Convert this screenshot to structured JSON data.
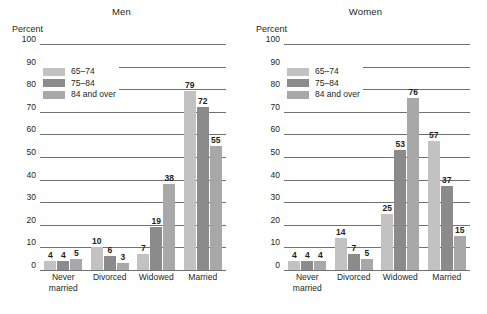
{
  "axis_title": "Percent",
  "legend": {
    "items": [
      {
        "label": "65–74",
        "color": "#c2c2c2"
      },
      {
        "label": "75–84",
        "color": "#8b8b8b"
      },
      {
        "label": "84 and over",
        "color": "#a8a8a8"
      }
    ]
  },
  "chart_data": [
    {
      "type": "bar",
      "title": "Men",
      "xlabel": "",
      "ylabel": "Percent",
      "ylim": [
        0,
        100
      ],
      "yticks": [
        0,
        10,
        20,
        30,
        40,
        50,
        60,
        70,
        80,
        90,
        100
      ],
      "grid": true,
      "legend_position": "upper-left",
      "categories": [
        "Never married",
        "Divorced",
        "Widowed",
        "Married"
      ],
      "series": [
        {
          "name": "65–74",
          "color": "#c2c2c2",
          "values": [
            4,
            10,
            7,
            79
          ]
        },
        {
          "name": "75–84",
          "color": "#8b8b8b",
          "values": [
            4,
            6,
            19,
            72
          ]
        },
        {
          "name": "84 and over",
          "color": "#a8a8a8",
          "values": [
            5,
            3,
            38,
            55
          ]
        }
      ]
    },
    {
      "type": "bar",
      "title": "Women",
      "xlabel": "",
      "ylabel": "Percent",
      "ylim": [
        0,
        100
      ],
      "yticks": [
        0,
        10,
        20,
        30,
        40,
        50,
        60,
        70,
        80,
        90,
        100
      ],
      "grid": true,
      "legend_position": "upper-left",
      "categories": [
        "Never married",
        "Divorced",
        "Widowed",
        "Married"
      ],
      "series": [
        {
          "name": "65–74",
          "color": "#c2c2c2",
          "values": [
            4,
            14,
            25,
            57
          ]
        },
        {
          "name": "75–84",
          "color": "#8b8b8b",
          "values": [
            4,
            7,
            53,
            37
          ]
        },
        {
          "name": "84 and over",
          "color": "#a8a8a8",
          "values": [
            4,
            5,
            76,
            15
          ]
        }
      ]
    }
  ]
}
